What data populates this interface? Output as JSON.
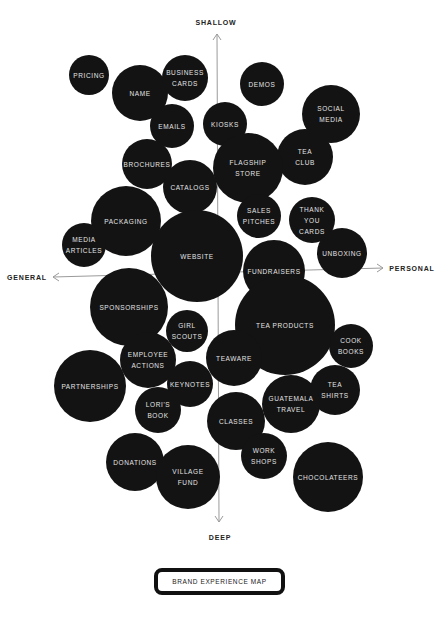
{
  "axes": {
    "top": {
      "label": "SHALLOW",
      "x": 216,
      "y": 22
    },
    "bottom": {
      "label": "DEEP",
      "x": 220,
      "y": 537
    },
    "left": {
      "label": "GENERAL",
      "x": 27,
      "y": 277
    },
    "right": {
      "label": "PERSONAL",
      "x": 412,
      "y": 268
    },
    "vertical_line": {
      "x1": 217,
      "y1": 34,
      "x2": 219,
      "y2": 522
    },
    "horizontal_line": {
      "x1": 53,
      "y1": 277,
      "x2": 383,
      "y2": 268
    },
    "line_color": "#9a9a9a"
  },
  "bubbles": [
    {
      "label": "PRICING",
      "cx": 89,
      "cy": 75,
      "r": 20
    },
    {
      "label": "NAME",
      "cx": 140,
      "cy": 93,
      "r": 28
    },
    {
      "label": "BUSINESS\nCARDS",
      "cx": 185,
      "cy": 78,
      "r": 23
    },
    {
      "label": "EMAILS",
      "cx": 172,
      "cy": 126,
      "r": 22
    },
    {
      "label": "DEMOS",
      "cx": 262,
      "cy": 84,
      "r": 22
    },
    {
      "label": "SOCIAL\nMEDIA",
      "cx": 331,
      "cy": 114,
      "r": 29
    },
    {
      "label": "KIOSKS",
      "cx": 225,
      "cy": 124,
      "r": 22
    },
    {
      "label": "TEA\nCLUB",
      "cx": 305,
      "cy": 157,
      "r": 28
    },
    {
      "label": "FLAGSHIP\nSTORE",
      "cx": 248,
      "cy": 168,
      "r": 35
    },
    {
      "label": "BROCHURES",
      "cx": 147,
      "cy": 164,
      "r": 25
    },
    {
      "label": "CATALOGS",
      "cx": 190,
      "cy": 187,
      "r": 27
    },
    {
      "label": "PACKAGING",
      "cx": 126,
      "cy": 221,
      "r": 35
    },
    {
      "label": "MEDIA\nARTICLES",
      "cx": 84,
      "cy": 245,
      "r": 22
    },
    {
      "label": "WEBSITE",
      "cx": 197,
      "cy": 256,
      "r": 46
    },
    {
      "label": "SALES\nPITCHES",
      "cx": 259,
      "cy": 216,
      "r": 22
    },
    {
      "label": "THANK\nYOU\nCARDS",
      "cx": 312,
      "cy": 220,
      "r": 23
    },
    {
      "label": "UNBOXING",
      "cx": 342,
      "cy": 253,
      "r": 25
    },
    {
      "label": "FUNDRAISERS",
      "cx": 274,
      "cy": 271,
      "r": 31
    },
    {
      "label": "SPONSORSHIPS",
      "cx": 129,
      "cy": 307,
      "r": 39
    },
    {
      "label": "GIRL\nSCOUTS",
      "cx": 187,
      "cy": 331,
      "r": 21
    },
    {
      "label": "TEA PRODUCTS",
      "cx": 285,
      "cy": 325,
      "r": 50
    },
    {
      "label": "EMPLOYEE\nACTIONS",
      "cx": 148,
      "cy": 360,
      "r": 28
    },
    {
      "label": "TEAWARE",
      "cx": 234,
      "cy": 358,
      "r": 28
    },
    {
      "label": "COOK\nBOOKS",
      "cx": 351,
      "cy": 346,
      "r": 22
    },
    {
      "label": "PARTNERSHIPS",
      "cx": 90,
      "cy": 386,
      "r": 36
    },
    {
      "label": "KEYNOTES",
      "cx": 190,
      "cy": 384,
      "r": 23
    },
    {
      "label": "TEA\nSHIRTS",
      "cx": 335,
      "cy": 390,
      "r": 25
    },
    {
      "label": "GUATEMALA\nTRAVEL",
      "cx": 291,
      "cy": 404,
      "r": 29
    },
    {
      "label": "LORI'S\nBOOK",
      "cx": 158,
      "cy": 410,
      "r": 23
    },
    {
      "label": "CLASSES",
      "cx": 236,
      "cy": 421,
      "r": 29
    },
    {
      "label": "WORK\nSHOPS",
      "cx": 264,
      "cy": 456,
      "r": 23
    },
    {
      "label": "DONATIONS",
      "cx": 135,
      "cy": 462,
      "r": 29
    },
    {
      "label": "VILLAGE\nFUND",
      "cx": 188,
      "cy": 477,
      "r": 32
    },
    {
      "label": "CHOCOLATEERS",
      "cx": 328,
      "cy": 477,
      "r": 35
    }
  ],
  "colors": {
    "bubble_fill": "#131313",
    "bubble_text": "#e4e4e4",
    "axis_text": "#222222"
  },
  "title": {
    "label": "BRAND EXPERIENCE MAP"
  }
}
